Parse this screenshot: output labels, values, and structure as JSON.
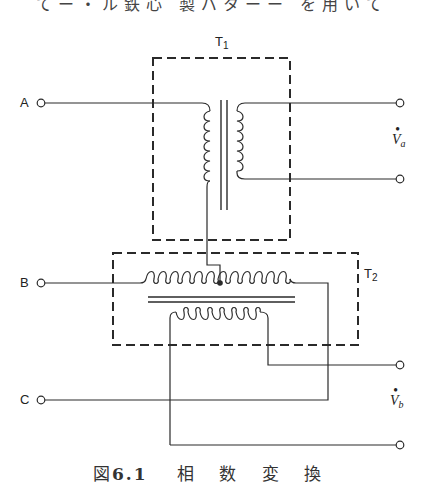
{
  "header_fragment": "てー・ル鉄心 製バターー を用いて",
  "transformers": {
    "t1": {
      "label": "T",
      "subscript": "1"
    },
    "t2": {
      "label": "T",
      "subscript": "2"
    }
  },
  "terminals": {
    "a": "A",
    "b": "B",
    "c": "C"
  },
  "outputs": {
    "va": {
      "symbol": "V",
      "subscript": "a",
      "dot": "•"
    },
    "vb": {
      "symbol": "V",
      "subscript": "b",
      "dot": "•"
    }
  },
  "caption": {
    "prefix": "図",
    "number": "6.1",
    "words": [
      "相",
      "数",
      "変",
      "換"
    ]
  },
  "colors": {
    "line": "#2a2a2a",
    "background": "#ffffff"
  }
}
